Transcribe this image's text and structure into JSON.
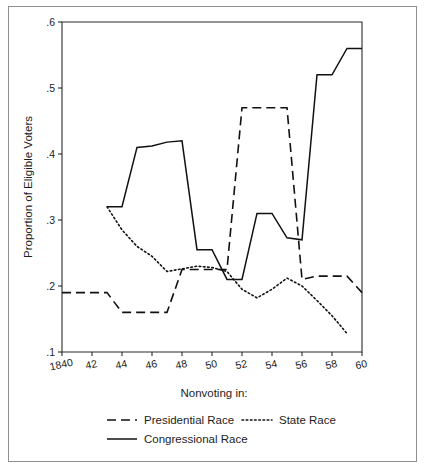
{
  "figure": {
    "background_color": "#ffffff",
    "frame_color": "#8f8f8f",
    "line_color": "#111111"
  },
  "axes": {
    "y_title": "Proportion of Eligible Voters",
    "y_ticks": [
      ".1",
      ".2",
      ".3",
      ".4",
      ".5",
      ".6"
    ],
    "y_tick_values": [
      0.1,
      0.2,
      0.3,
      0.4,
      0.5,
      0.6
    ],
    "x_ticks": [
      "1840",
      "42",
      "44",
      "46",
      "48",
      "50",
      "52",
      "54",
      "56",
      "58",
      "60"
    ],
    "x_tick_values": [
      1840,
      1842,
      1844,
      1846,
      1848,
      1850,
      1852,
      1854,
      1856,
      1858,
      1860
    ],
    "x_caption": "Nonvoting in:"
  },
  "legend": {
    "title": "Nonvoting in:",
    "entries": [
      {
        "label": "Presidential Race",
        "style": "dashed"
      },
      {
        "label": "State Race",
        "style": "dotted"
      },
      {
        "label": "Congressional Race",
        "style": "solid"
      }
    ]
  },
  "chart_data": {
    "type": "line",
    "title": "",
    "subtitle": "",
    "xlabel": "Nonvoting in:",
    "ylabel": "Proportion of Eligible Voters",
    "xlim": [
      1840,
      1860
    ],
    "ylim": [
      0.1,
      0.6
    ],
    "grid": false,
    "legend_position": "bottom",
    "series": [
      {
        "name": "Presidential Race",
        "style": "dashed",
        "x": [
          1840,
          1841,
          1842,
          1843,
          1844,
          1845,
          1846,
          1847,
          1848,
          1849,
          1850,
          1851,
          1852,
          1853,
          1854,
          1855,
          1856,
          1857,
          1858,
          1859,
          1860
        ],
        "values": [
          0.19,
          0.19,
          0.19,
          0.19,
          0.16,
          0.16,
          0.16,
          0.16,
          0.225,
          0.225,
          0.225,
          0.225,
          0.47,
          0.47,
          0.47,
          0.47,
          0.21,
          0.215,
          0.215,
          0.215,
          0.19
        ]
      },
      {
        "name": "State Race",
        "style": "dotted",
        "x": [
          1843,
          1844,
          1845,
          1846,
          1847,
          1848,
          1849,
          1850,
          1851,
          1852,
          1853,
          1854,
          1855,
          1856,
          1857,
          1858,
          1859
        ],
        "values": [
          0.32,
          0.285,
          0.26,
          0.245,
          0.222,
          0.226,
          0.23,
          0.228,
          0.222,
          0.195,
          0.182,
          0.195,
          0.212,
          0.2,
          0.178,
          0.155,
          0.128
        ]
      },
      {
        "name": "Congressional Race",
        "style": "solid",
        "x": [
          1843,
          1844,
          1845,
          1846,
          1847,
          1848,
          1849,
          1850,
          1851,
          1852,
          1853,
          1854,
          1855,
          1856,
          1857,
          1858,
          1859,
          1860
        ],
        "values": [
          0.32,
          0.32,
          0.41,
          0.412,
          0.418,
          0.42,
          0.255,
          0.255,
          0.21,
          0.21,
          0.31,
          0.31,
          0.273,
          0.27,
          0.52,
          0.52,
          0.56,
          0.56
        ]
      }
    ]
  }
}
